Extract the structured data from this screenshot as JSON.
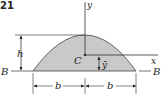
{
  "figure": {
    "problem_number": "21",
    "colors": {
      "fill": "#c9c9c9",
      "line": "#333333"
    },
    "labels": {
      "y_axis": "y",
      "x_axis": "x",
      "centroid": "C",
      "ybar": "ȳ",
      "height": "h",
      "base_left": "B",
      "base_right": "B",
      "half_width_left": "b",
      "half_width_right": "b"
    }
  }
}
